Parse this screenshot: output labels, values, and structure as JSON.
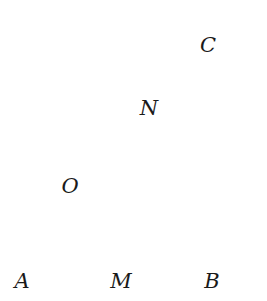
{
  "figure": {
    "type": "geometry-diagram",
    "canvas": {
      "width": 267,
      "height": 301
    },
    "colors": {
      "stroke": "#1a1a1a",
      "thick_stroke": "#000000",
      "dotted_stroke": "#3a3a3a",
      "background": "#ffffff",
      "label": "#1a1a1a"
    },
    "strokes": {
      "edge_width": 1.4,
      "thick_width": 3.4,
      "dot_width": 1.7,
      "dot_dash": "1 5"
    }
  },
  "labels": [
    {
      "id": "A",
      "text": "A",
      "x": 22,
      "y": 281
    },
    {
      "id": "M",
      "text": "M",
      "x": 121,
      "y": 281
    },
    {
      "id": "B",
      "text": "B",
      "x": 212,
      "y": 281
    },
    {
      "id": "O",
      "text": "O",
      "x": 70,
      "y": 186
    },
    {
      "id": "N",
      "text": "N",
      "x": 149,
      "y": 108
    },
    {
      "id": "C",
      "text": "C",
      "x": 208,
      "y": 45
    }
  ],
  "points": {
    "A": {
      "x": 20,
      "y": 258
    },
    "B": {
      "x": 211,
      "y": 258
    },
    "M": {
      "x": 119,
      "y": 258
    },
    "O": {
      "x": 85,
      "y": 196
    },
    "N": {
      "x": 147,
      "y": 133
    },
    "C": {
      "x": 211,
      "y": 62
    },
    "front_top_left": {
      "x": 20,
      "y": 62
    },
    "front_top_right": {
      "x": 211,
      "y": 62
    },
    "back_top_left": {
      "x": 84,
      "y": 17
    },
    "back_top_right": {
      "x": 255,
      "y": 17
    },
    "back_bottom_right": {
      "x": 255,
      "y": 196
    }
  },
  "segments": {
    "front_face": "M 20 62 L 211 62 L 211 258 L 20 258 Z",
    "top_back_left_edge": "M 20 62 L 84 17",
    "top_back_edge": "M 84 17 L 255 17",
    "top_back_right_edge": "M 255 17 L 211 62",
    "right_back_vertical": "M 255 17 L 255 196",
    "right_back_bottom_edge": "M 255 196 L 211 258",
    "hidden_vertical_back_left": "M 84 17 L 85 196",
    "hidden_bottom_back_edge": "M 85 196 L 255 196",
    "hidden_bottom_left_diagonal": "M 20 258 L 85 196",
    "hidden_MN": "M 119 258 L 147 133",
    "diagonal_OC": "M 85 196 L 211 62",
    "thick_bottom_AB": "M 20 258 L 211 258"
  }
}
